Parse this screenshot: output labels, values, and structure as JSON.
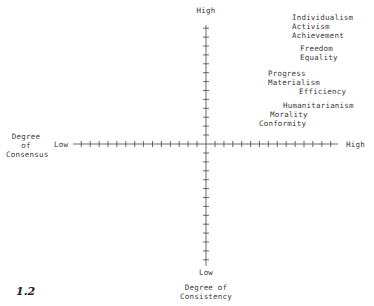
{
  "figure_number": "1.2",
  "axes": {
    "horizontal": {
      "name_lines": [
        "Degree",
        "of",
        "Consensus"
      ],
      "low_label": "Low",
      "high_label": "High"
    },
    "vertical": {
      "name_lines": [
        "Degree of",
        "Consistency"
      ],
      "low_label": "Low",
      "high_label": "High"
    }
  },
  "value_groups": [
    {
      "items": [
        "Individualism",
        "Activism",
        "Achievement"
      ]
    },
    {
      "items": [
        "Freedom",
        "Equality"
      ]
    },
    {
      "items": [
        "Progress",
        "Materialism",
        "Efficiency"
      ]
    },
    {
      "items": [
        "Humanitarianism",
        "Morality",
        "Conformity"
      ]
    }
  ],
  "colors": {
    "ink": "#3a3a3a",
    "background": "#ffffff"
  }
}
